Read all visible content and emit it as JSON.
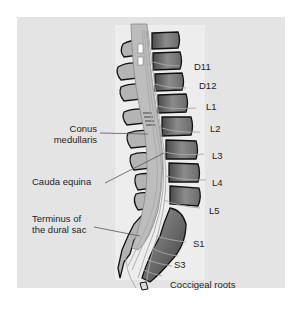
{
  "diagram": {
    "colors": {
      "panel": "#e4e4e4",
      "column": "#ededed",
      "bone": "#8a8a8a",
      "bone_dark": "#555555",
      "outline": "#111111",
      "nerve": "#b0b0b0",
      "leader": "#555555"
    },
    "vertebra_labels": [
      {
        "id": "d11",
        "text": "D11"
      },
      {
        "id": "d12",
        "text": "D12"
      },
      {
        "id": "l1",
        "text": "L1"
      },
      {
        "id": "l2",
        "text": "L2"
      },
      {
        "id": "l3",
        "text": "L3"
      },
      {
        "id": "l4",
        "text": "L4"
      },
      {
        "id": "l5",
        "text": "L5"
      },
      {
        "id": "s1",
        "text": "S1"
      },
      {
        "id": "s3",
        "text": "S3"
      }
    ],
    "structure_labels": {
      "conus_line1": "Conus",
      "conus_line2": "medullaris",
      "cauda": "Cauda equina",
      "terminus_line1": "Terminus of",
      "terminus_line2": "the dural sac",
      "coccigeal": "Coccigeal roots"
    }
  }
}
